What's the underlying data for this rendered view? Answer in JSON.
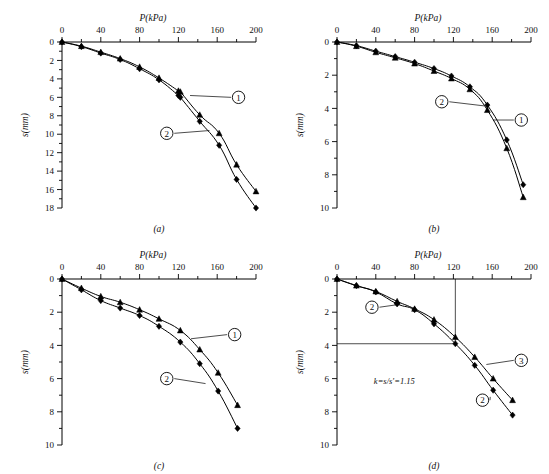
{
  "figure": {
    "caption_style": "four-panel load-settlement curves",
    "panels": [
      "a",
      "b",
      "c",
      "d"
    ]
  },
  "chart_data": [
    {
      "type": "line",
      "panel": "a",
      "caption": "(a)",
      "title": "",
      "xlabel": "P(kPa)",
      "ylabel": "s(mm)",
      "xlim": [
        0,
        200
      ],
      "ylim": [
        0,
        18
      ],
      "y_inverted": true,
      "x_axis_position": "top",
      "xticks": [
        0,
        40,
        80,
        120,
        160,
        200
      ],
      "xtick_labels": [
        "0",
        "40",
        "80",
        "120",
        "160",
        "200"
      ],
      "xminor_step": 20,
      "yticks": [
        0,
        2,
        4,
        6,
        8,
        10,
        12,
        14,
        16,
        18
      ],
      "ytick_labels": [
        "0",
        "2",
        "4",
        "6",
        "8",
        "10",
        "12",
        "14",
        "16",
        "18"
      ],
      "yminor_step": 1,
      "grid": false,
      "legend": "inline-callouts",
      "series": [
        {
          "name": "1",
          "label": "①",
          "marker": "triangle",
          "x": [
            0,
            20,
            40,
            60,
            80,
            100,
            120,
            122,
            142,
            162,
            180,
            200
          ],
          "y": [
            0,
            0.45,
            1.1,
            1.8,
            2.7,
            3.9,
            5.3,
            5.4,
            7.9,
            9.9,
            13.3,
            16.2
          ]
        },
        {
          "name": "2",
          "label": "②",
          "marker": "diamond",
          "x": [
            0,
            20,
            40,
            60,
            80,
            100,
            120,
            122,
            142,
            162,
            180,
            200
          ],
          "y": [
            0,
            0.5,
            1.2,
            1.9,
            2.9,
            4.1,
            5.8,
            6.0,
            8.6,
            11.2,
            14.9,
            18.0
          ]
        }
      ],
      "annotations": [
        {
          "text": "①",
          "kind": "circled-callout",
          "series": "1"
        },
        {
          "text": "②",
          "kind": "circled-callout",
          "series": "2"
        }
      ]
    },
    {
      "type": "line",
      "panel": "b",
      "caption": "(b)",
      "title": "",
      "xlabel": "P(kPa)",
      "ylabel": "s(mm)",
      "xlim": [
        0,
        200
      ],
      "ylim": [
        0,
        10
      ],
      "y_inverted": true,
      "x_axis_position": "top",
      "xticks": [
        0,
        40,
        80,
        120,
        160,
        200
      ],
      "xtick_labels": [
        "0",
        "40",
        "80",
        "120",
        "160",
        "200"
      ],
      "xminor_step": 20,
      "yticks": [
        0,
        2,
        4,
        6,
        8,
        10
      ],
      "ytick_labels": [
        "0",
        "2",
        "4",
        "6",
        "8",
        "10"
      ],
      "yminor_step": 1,
      "grid": false,
      "legend": "inline-callouts",
      "series": [
        {
          "name": "1",
          "label": "①",
          "marker": "triangle",
          "x": [
            0,
            20,
            40,
            60,
            80,
            100,
            118,
            137,
            155,
            175,
            192
          ],
          "y": [
            0,
            0.25,
            0.62,
            0.95,
            1.3,
            1.75,
            2.2,
            2.85,
            4.1,
            6.4,
            9.35
          ]
        },
        {
          "name": "2",
          "label": "②",
          "marker": "diamond",
          "x": [
            0,
            20,
            40,
            60,
            80,
            100,
            118,
            137,
            155,
            175,
            192
          ],
          "y": [
            0,
            0.22,
            0.55,
            0.88,
            1.22,
            1.6,
            2.05,
            2.7,
            3.8,
            5.9,
            8.6
          ]
        }
      ],
      "annotations": [
        {
          "text": "①",
          "kind": "circled-callout",
          "series": "1"
        },
        {
          "text": "②",
          "kind": "circled-callout",
          "series": "2"
        }
      ]
    },
    {
      "type": "line",
      "panel": "c",
      "caption": "(c)",
      "title": "",
      "xlabel": "P(kPa)",
      "ylabel": "s(mm)",
      "xlim": [
        0,
        200
      ],
      "ylim": [
        0,
        10
      ],
      "y_inverted": true,
      "x_axis_position": "top",
      "xticks": [
        0,
        40,
        80,
        120,
        160,
        200
      ],
      "xtick_labels": [
        "0",
        "40",
        "80",
        "120",
        "160",
        "200"
      ],
      "xminor_step": 20,
      "yticks": [
        0,
        2,
        4,
        6,
        8,
        10
      ],
      "ytick_labels": [
        "0",
        "2",
        "4",
        "6",
        "8",
        "10"
      ],
      "yminor_step": 1,
      "grid": false,
      "legend": "inline-callouts",
      "series": [
        {
          "name": "1",
          "label": "①",
          "marker": "triangle",
          "x": [
            0,
            20,
            40,
            60,
            80,
            100,
            122,
            142,
            161,
            181
          ],
          "y": [
            0,
            0.55,
            1.05,
            1.4,
            1.85,
            2.4,
            3.1,
            4.25,
            5.65,
            7.6
          ]
        },
        {
          "name": "2",
          "label": "②",
          "marker": "diamond",
          "x": [
            0,
            20,
            40,
            60,
            80,
            100,
            122,
            142,
            161,
            181
          ],
          "y": [
            0,
            0.65,
            1.3,
            1.75,
            2.2,
            2.85,
            3.8,
            5.1,
            6.75,
            9.0
          ]
        }
      ],
      "annotations": [
        {
          "text": "①",
          "kind": "circled-callout",
          "series": "1"
        },
        {
          "text": "②",
          "kind": "circled-callout",
          "series": "2"
        }
      ]
    },
    {
      "type": "line",
      "panel": "d",
      "caption": "(d)",
      "title": "",
      "xlabel": "P(kPa)",
      "ylabel": "s(mm)",
      "xlim": [
        0,
        200
      ],
      "ylim": [
        0,
        10
      ],
      "y_inverted": true,
      "x_axis_position": "top",
      "xticks": [
        0,
        40,
        80,
        120,
        160,
        200
      ],
      "xtick_labels": [
        "0",
        "40",
        "80",
        "120",
        "160",
        "200"
      ],
      "xminor_step": 20,
      "yticks": [
        0,
        2,
        4,
        6,
        8,
        10
      ],
      "ytick_labels": [
        "0",
        "2",
        "4",
        "6",
        "8",
        "10"
      ],
      "yminor_step": 1,
      "grid": false,
      "legend": "inline-callouts",
      "note": "k=s/s'=1.15",
      "construction_lines": {
        "x": 122,
        "y": 3.9
      },
      "series": [
        {
          "name": "3",
          "label": "③",
          "marker": "triangle",
          "x": [
            0,
            20,
            40,
            62,
            80,
            100,
            122,
            142,
            161,
            181
          ],
          "y": [
            0,
            0.4,
            0.75,
            1.35,
            1.8,
            2.45,
            3.5,
            4.7,
            6.0,
            7.3
          ]
        },
        {
          "name": "2",
          "label": "②",
          "marker": "diamond",
          "x": [
            0,
            20,
            40,
            62,
            80,
            100,
            122,
            142,
            161,
            181
          ],
          "y": [
            0,
            0.4,
            0.78,
            1.5,
            1.85,
            2.7,
            3.9,
            5.2,
            6.7,
            8.2
          ]
        }
      ],
      "annotations": [
        {
          "text": "②",
          "kind": "circled-callout",
          "series": "2",
          "position": "upper-left"
        },
        {
          "text": "③",
          "kind": "circled-callout",
          "series": "3",
          "position": "right"
        },
        {
          "text": "②",
          "kind": "circled-callout",
          "series": "2",
          "position": "lower-right"
        },
        {
          "text": "k=s/s'=1.15",
          "kind": "text-note"
        }
      ]
    }
  ]
}
